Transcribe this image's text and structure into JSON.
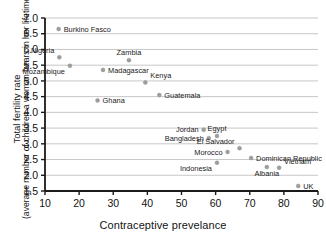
{
  "chart_data": {
    "type": "scatter",
    "title": "",
    "xlabel": "Contraceptive prevelance",
    "ylabel_line1": "Total fertility rate",
    "ylabel_line2": "(average number of children a woman bears in her lifetime)",
    "xlim": [
      10,
      90
    ],
    "ylim": [
      1.5,
      7.0
    ],
    "xticks": [
      10,
      20,
      30,
      40,
      50,
      60,
      70,
      80,
      90
    ],
    "yticks": [
      1.5,
      2.0,
      2.5,
      3.0,
      3.5,
      4.0,
      4.5,
      5.0,
      5.5,
      6.0,
      6.5,
      7.0
    ],
    "xtick_labels": [
      "10",
      "20",
      "30",
      "40",
      "50",
      "60",
      "70",
      "80",
      "90"
    ],
    "ytick_labels": [
      "1.5",
      "2.0",
      "2.5",
      "3.0",
      "3.5",
      "4.0",
      "4.5",
      "5.0",
      "5.5",
      "6.0",
      "6.5",
      "7.0"
    ],
    "grid": "horizontal",
    "legend": "none",
    "marker_color": "#9e9e9e",
    "grid_color": "#b9b9b9",
    "axis_color": "#1a1a1a",
    "points": [
      {
        "label": "Burkino Fasco",
        "x": 14.0,
        "y": 6.65,
        "label_pos": "right"
      },
      {
        "label": "Nigeria",
        "x": 14.2,
        "y": 5.75,
        "label_pos": "upleft"
      },
      {
        "label": "Mozambique",
        "x": 17.3,
        "y": 5.48,
        "label_pos": "downleft"
      },
      {
        "label": "Zambia",
        "x": 34.6,
        "y": 5.66,
        "label_pos": "up"
      },
      {
        "label": "Madagascar",
        "x": 27.0,
        "y": 5.35,
        "label_pos": "right"
      },
      {
        "label": "Kenya",
        "x": 39.4,
        "y": 4.95,
        "label_pos": "upright"
      },
      {
        "label": "Guatemala",
        "x": 43.5,
        "y": 4.55,
        "label_pos": "right"
      },
      {
        "label": "Ghana",
        "x": 25.4,
        "y": 4.38,
        "label_pos": "right"
      },
      {
        "label": "Jordan",
        "x": 56.5,
        "y": 3.45,
        "label_pos": "left"
      },
      {
        "label": "Egypt",
        "x": 60.4,
        "y": 3.25,
        "label_pos": "up"
      },
      {
        "label": "Bangladesh",
        "x": 58.0,
        "y": 3.18,
        "label_pos": "left"
      },
      {
        "label": "El Salvador",
        "x": 67.0,
        "y": 2.86,
        "label_pos": "upleft"
      },
      {
        "label": "Morocco",
        "x": 63.5,
        "y": 2.74,
        "label_pos": "left"
      },
      {
        "label": "Dominican Republic",
        "x": 70.4,
        "y": 2.55,
        "label_pos": "right"
      },
      {
        "label": "Indonesia",
        "x": 60.4,
        "y": 2.4,
        "label_pos": "downleft"
      },
      {
        "label": "Albania",
        "x": 75.0,
        "y": 2.26,
        "label_pos": "down"
      },
      {
        "label": "Vietnam",
        "x": 78.6,
        "y": 2.24,
        "label_pos": "upright"
      },
      {
        "label": "UK",
        "x": 84.2,
        "y": 1.66,
        "label_pos": "right"
      }
    ]
  }
}
